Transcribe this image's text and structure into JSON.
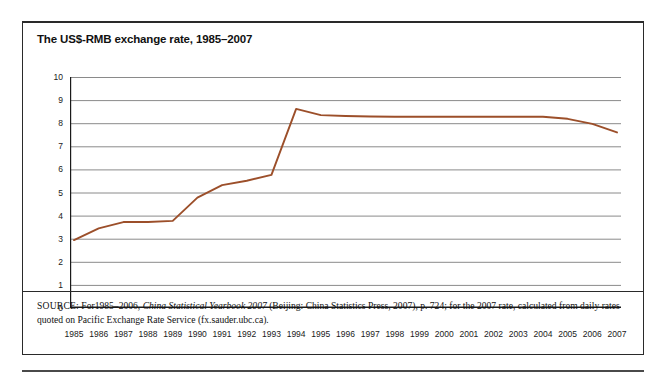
{
  "page": {
    "top_cut_text": "",
    "bottom_cut_text": ""
  },
  "figure": {
    "title": "The US$-RMB exchange rate, 1985–2007",
    "source_label": "SOURCE:",
    "source_text_1": " For1985–2006, ",
    "source_italic": "China Statistical Yearbook 2007",
    "source_text_2": " (Beijing: China Statistics Press, 2007), p. 724; for the 2007 rate, calculated from daily rates quoted on Pacific Exchange Rate Service (fx.sauder.ubc.ca)."
  },
  "colors": {
    "line": "#9c4f2a",
    "grid": "#8a8a8a",
    "axis": "#1a1a1a",
    "frame": "#2a2a2a"
  },
  "chart_data": {
    "type": "line",
    "title": "The US$-RMB exchange rate, 1985–2007",
    "xlabel": "",
    "ylabel": "",
    "ylim": [
      0,
      10
    ],
    "ytick_step": 1,
    "yticks": [
      10,
      9,
      8,
      7,
      6,
      5,
      4,
      3,
      2,
      1,
      0
    ],
    "grid": true,
    "grid_axis": "y",
    "legend": false,
    "categories": [
      "1985",
      "1986",
      "1987",
      "1988",
      "1989",
      "1990",
      "1991",
      "1992",
      "1993",
      "1994",
      "1995",
      "1996",
      "1997",
      "1998",
      "1999",
      "2000",
      "2001",
      "2002",
      "2003",
      "2004",
      "2005",
      "2006",
      "2007"
    ],
    "series": [
      {
        "name": "US$-RMB exchange rate",
        "values": [
          2.94,
          3.45,
          3.72,
          3.72,
          3.77,
          4.78,
          5.32,
          5.51,
          5.76,
          8.62,
          8.35,
          8.31,
          8.29,
          8.28,
          8.28,
          8.28,
          8.28,
          8.28,
          8.28,
          8.28,
          8.19,
          7.97,
          7.6
        ]
      }
    ]
  }
}
